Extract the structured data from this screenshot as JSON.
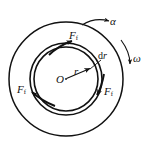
{
  "figure": {
    "kind": "mechanics-free-body-diagram",
    "background_color": "#ffffff",
    "stroke_color": "#111111",
    "canvas": {
      "width": 152,
      "height": 150
    }
  },
  "geometry": {
    "center": {
      "x": 66,
      "y": 79
    },
    "outer_disc_radius": 57,
    "ring_outer_radius": 36,
    "ring_inner_radius": 32,
    "radius_arrow": {
      "from_x": 66,
      "from_y": 79,
      "to_x": 93,
      "to_y": 67
    }
  },
  "labels": {
    "friction_top": {
      "symbol": "F",
      "subscript": "f"
    },
    "friction_left": {
      "symbol": "F",
      "subscript": "f"
    },
    "friction_right": {
      "symbol": "F",
      "subscript": "f"
    },
    "radius": "r",
    "center": "O",
    "thickness": "dr",
    "angular_acceleration": "α",
    "angular_velocity": "ω"
  },
  "annotations": {
    "leader_dr": {
      "from_x": 100,
      "from_y": 60,
      "to_x": 89,
      "to_y": 70
    },
    "alpha_arc": {
      "start_x": 83,
      "start_y": 24,
      "end_x": 111,
      "end_y": 22
    },
    "omega_arc": {
      "start_x": 124,
      "start_y": 43,
      "end_x": 131,
      "end_y": 66
    }
  }
}
